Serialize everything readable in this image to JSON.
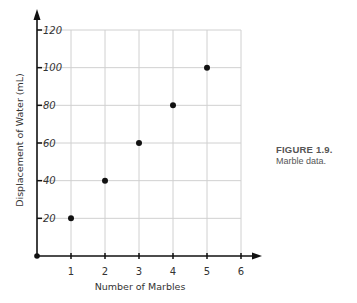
{
  "chart_data": {
    "type": "scatter",
    "title": "",
    "xlabel": "Number of Marbles",
    "ylabel": "Displacement of Water (mL)",
    "x_ticks": [
      "1",
      "2",
      "3",
      "4",
      "5",
      "6"
    ],
    "y_ticks": [
      "20",
      "40",
      "60",
      "80",
      "100",
      "120"
    ],
    "xlim": [
      0,
      6
    ],
    "ylim": [
      0,
      120
    ],
    "grid": true,
    "legend": null,
    "series": [
      {
        "name": "Marble data",
        "x": [
          1,
          2,
          3,
          4,
          5
        ],
        "y": [
          20,
          40,
          60,
          80,
          100
        ]
      }
    ],
    "colors": {
      "points": "#111111",
      "grid": "#d0d0d0",
      "axis": "#111111"
    }
  },
  "caption": {
    "figure_label": "FIGURE 1.9.",
    "text": "Marble data."
  }
}
